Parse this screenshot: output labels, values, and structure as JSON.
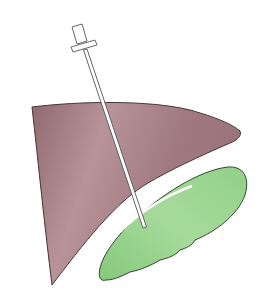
{
  "figure": {
    "title": "Needle inserted through liver into gallbladder",
    "colors": {
      "background": "#ffffff",
      "liver_fill": "#a07a80",
      "liver_fill_light": "#b8939a",
      "liver_outline": "#4a3438",
      "gallbladder_fill": "#8fcf86",
      "gallbladder_fill_light": "#a6da9c",
      "gallbladder_outline": "#2f4a2c",
      "needle_fill": "#ffffff",
      "needle_outline": "#555555"
    },
    "parts": [
      {
        "name": "needle-hub",
        "label": "Needle hub"
      },
      {
        "name": "needle-shaft",
        "label": "Needle shaft"
      },
      {
        "name": "liver",
        "label": "Liver"
      },
      {
        "name": "gallbladder",
        "label": "Gallbladder"
      }
    ]
  }
}
